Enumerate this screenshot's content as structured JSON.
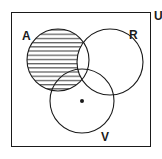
{
  "diagram": {
    "type": "venn-3-set",
    "universe": {
      "label": "U"
    },
    "sets": [
      {
        "id": "A",
        "label": "A"
      },
      {
        "id": "R",
        "label": "R"
      },
      {
        "id": "V",
        "label": "V"
      }
    ],
    "shaded_region": "A minus R (hatched horizontally)",
    "marked_point": {
      "region": "V only",
      "marker": "dot"
    },
    "colors": {
      "stroke": "#1a1a1a",
      "background": "#ffffff",
      "hatch": "#1a1a1a"
    }
  }
}
